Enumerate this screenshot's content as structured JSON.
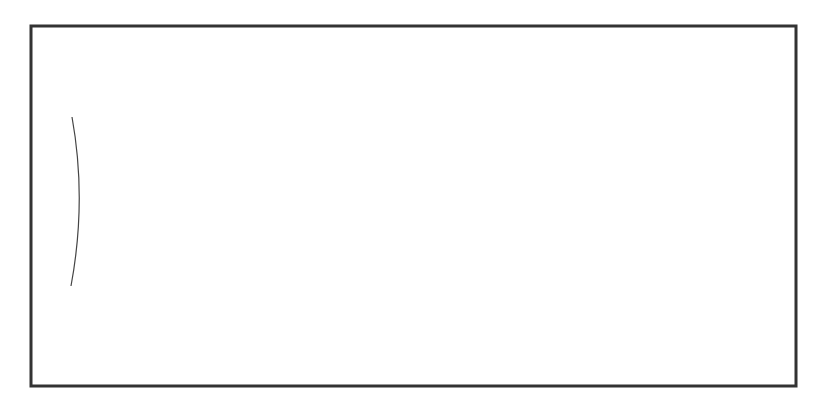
{
  "diagram": {
    "type": "guitar-fretboard-interval-map",
    "string_labels": {
      "top": "1S",
      "bottom": "6S"
    },
    "fret_numbers": [
      {
        "label": "5",
        "x": 137
      },
      {
        "label": "7",
        "x": 293
      },
      {
        "label": "9",
        "x": 455
      },
      {
        "label": "12",
        "x": 703
      }
    ],
    "strings_y": [
      98,
      139,
      179,
      219,
      259,
      300
    ],
    "frets_x": [
      97,
      177,
      256,
      335,
      416,
      497,
      578,
      659,
      742
    ],
    "notes": [
      {
        "label": "m2",
        "string": 1,
        "x": 216,
        "root": false
      },
      {
        "label": "m3",
        "string": 1,
        "x": 376,
        "root": false
      },
      {
        "label": "P4",
        "string": 1,
        "x": 538,
        "root": false
      },
      {
        "label": "P5",
        "string": 1,
        "x": 702,
        "root": false
      },
      {
        "label": "P5",
        "string": 2,
        "x": 136,
        "root": false
      },
      {
        "label": "m7",
        "string": 2,
        "x": 376,
        "root": false
      },
      {
        "label": "R",
        "string": 2,
        "x": 538,
        "root": true
      },
      {
        "label": "m3",
        "string": 3,
        "x": 136,
        "root": false
      },
      {
        "label": "P4",
        "string": 3,
        "x": 296,
        "root": false
      },
      {
        "label": "P5",
        "string": 3,
        "x": 457,
        "root": false
      }
    ],
    "colors": {
      "line": "#2a2a2a",
      "frame": "#333333",
      "background": "#ffffff"
    }
  }
}
